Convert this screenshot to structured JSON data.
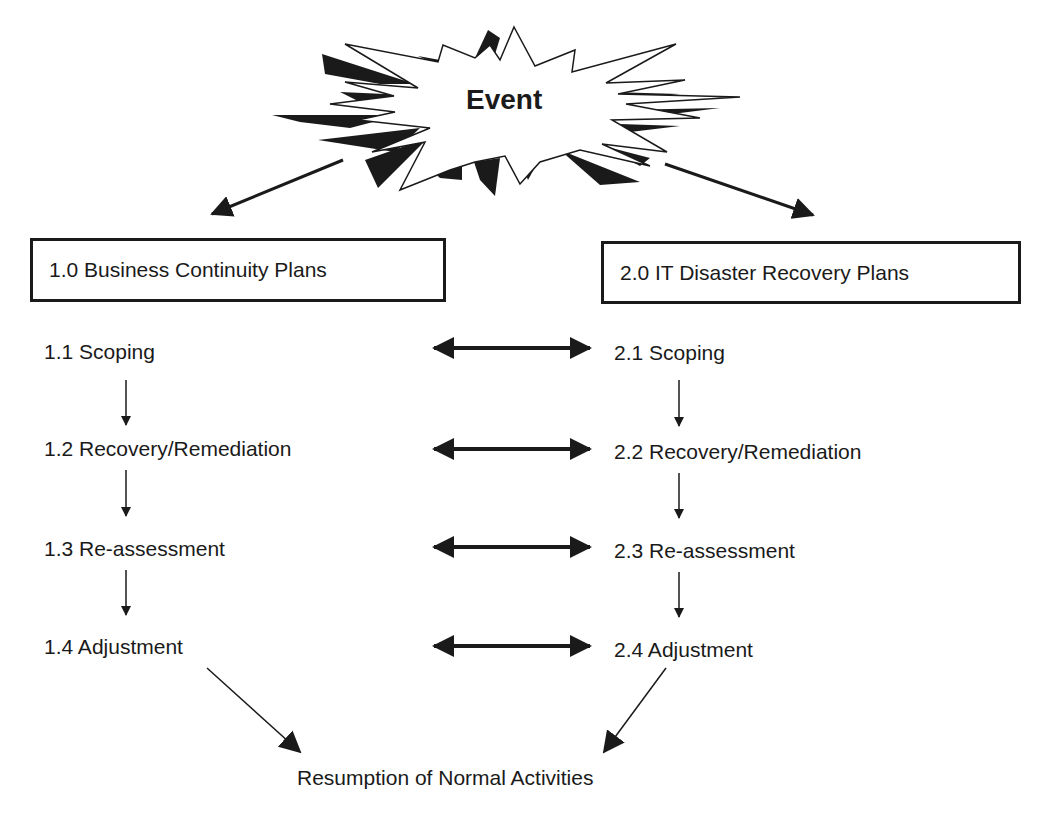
{
  "event": {
    "label": "Event",
    "shape": "starburst"
  },
  "columns": [
    {
      "header": "1.0 Business Continuity Plans",
      "steps": [
        "1.1 Scoping",
        "1.2 Recovery/Remediation",
        "1.3 Re-assessment",
        "1.4 Adjustment"
      ]
    },
    {
      "header": "2.0 IT Disaster Recovery Plans",
      "steps": [
        "2.1 Scoping",
        "2.2 Recovery/Remediation",
        "2.3 Re-assessment",
        "2.4 Adjustment"
      ]
    }
  ],
  "outcome": "Resumption of Normal Activities",
  "colors": {
    "ink": "#1a1a1a",
    "background": "#ffffff"
  }
}
